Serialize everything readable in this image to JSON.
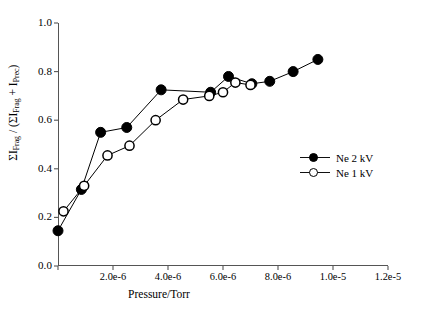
{
  "chart_data": {
    "type": "line",
    "title": "",
    "xlabel": "Pressure/Torr",
    "ylabel": "ΣI_Frag / (ΣI_Frag + I_Prec)",
    "xlim": [
      0,
      1.2e-05
    ],
    "ylim": [
      0,
      1.0
    ],
    "grid": false,
    "legend_position": "right-inside",
    "xticks": [
      {
        "value": 0.0,
        "label": ""
      },
      {
        "value": 2e-06,
        "label": "2.0e-6"
      },
      {
        "value": 4e-06,
        "label": "4.0e-6"
      },
      {
        "value": 6e-06,
        "label": "6.0e-6"
      },
      {
        "value": 8e-06,
        "label": "8.0e-6"
      },
      {
        "value": 1e-05,
        "label": "1.0e-5"
      },
      {
        "value": 1.2e-05,
        "label": "1.2e-5"
      }
    ],
    "yticks": [
      {
        "value": 0.0,
        "label": "0.0"
      },
      {
        "value": 0.2,
        "label": "0.2"
      },
      {
        "value": 0.4,
        "label": "0.4"
      },
      {
        "value": 0.6,
        "label": "0.6"
      },
      {
        "value": 0.8,
        "label": "0.8"
      },
      {
        "value": 1.0,
        "label": "1.0"
      }
    ],
    "series": [
      {
        "name": "Ne 2 kV",
        "marker": "filled-circle",
        "color": "#000000",
        "x": [
          0.0,
          8.5e-07,
          1.55e-06,
          2.5e-06,
          3.75e-06,
          5.55e-06,
          6.2e-06,
          7.05e-06,
          7.7e-06,
          8.55e-06,
          9.45e-06
        ],
        "y": [
          0.145,
          0.315,
          0.55,
          0.57,
          0.725,
          0.715,
          0.78,
          0.75,
          0.76,
          0.8,
          0.85
        ]
      },
      {
        "name": "Ne 1 kV",
        "marker": "open-circle",
        "color": "#000000",
        "x": [
          2e-07,
          9.5e-07,
          1.8e-06,
          2.6e-06,
          3.55e-06,
          4.55e-06,
          5.5e-06,
          6e-06,
          6.45e-06,
          7e-06
        ],
        "y": [
          0.225,
          0.33,
          0.455,
          0.495,
          0.6,
          0.685,
          0.7,
          0.715,
          0.755,
          0.745
        ]
      }
    ]
  },
  "axes": {
    "y_title_parts": {
      "sigma1": "ΣI",
      "sub1": "Frag",
      "slash": " / (",
      "sigma2": "ΣI",
      "sub2": "Frag",
      "plus": " + I",
      "sub3": "Prec",
      "close": ")"
    }
  },
  "legend": {
    "items": [
      {
        "label": "Ne 2 kV",
        "marker": "filled-circle"
      },
      {
        "label": "Ne 1 kV",
        "marker": "open-circle"
      }
    ]
  }
}
